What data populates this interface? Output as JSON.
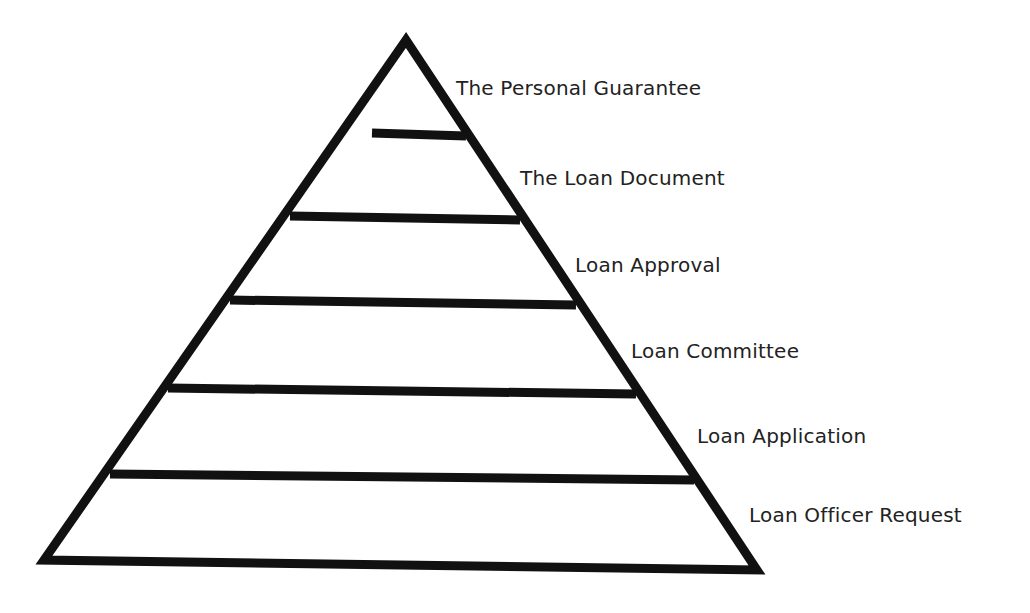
{
  "diagram": {
    "type": "pyramid",
    "stroke_color": "#111111",
    "background": "#ffffff",
    "levels_top_to_bottom": [
      {
        "label": "The Personal Guarantee"
      },
      {
        "label": "The Loan Document"
      },
      {
        "label": "Loan Approval"
      },
      {
        "label": "Loan Committee"
      },
      {
        "label": "Loan Application"
      },
      {
        "label": "Loan Officer Request"
      }
    ]
  }
}
